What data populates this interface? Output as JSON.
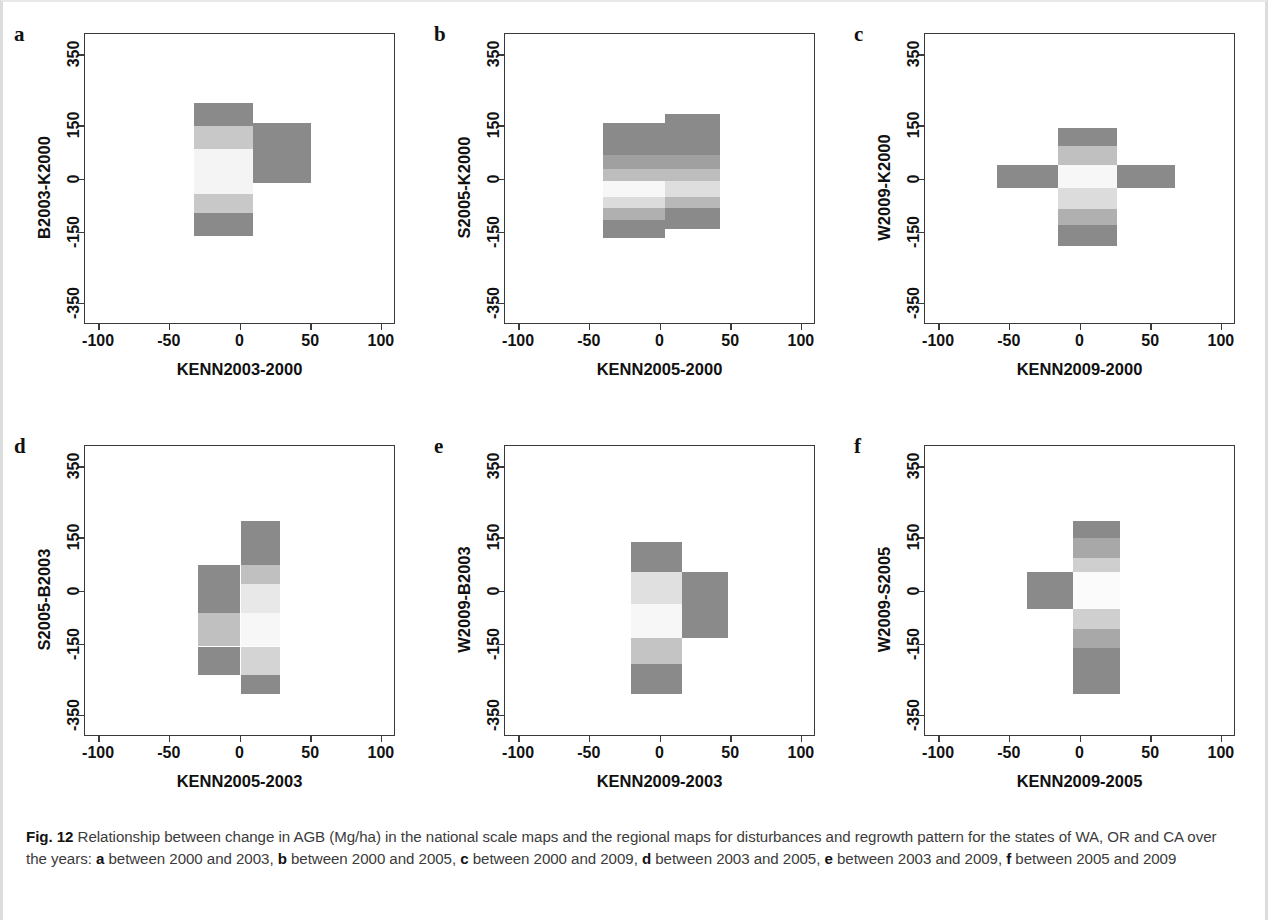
{
  "figure": {
    "number": "Fig. 12",
    "caption_parts": [
      {
        "t": "Fig. 12",
        "b": true
      },
      {
        "t": " Relationship between change in AGB (Mg/ha) in the national scale maps and the regional maps for disturbances and regrowth pattern for the states of WA, OR and CA over the years: ",
        "b": false
      },
      {
        "t": "a",
        "b": true
      },
      {
        "t": " between 2000 and 2003, ",
        "b": false
      },
      {
        "t": "b",
        "b": true
      },
      {
        "t": " between 2000 and 2005, ",
        "b": false
      },
      {
        "t": "c",
        "b": true
      },
      {
        "t": " between 2000 and 2009, ",
        "b": false
      },
      {
        "t": "d",
        "b": true
      },
      {
        "t": " between 2003 and 2005, ",
        "b": false
      },
      {
        "t": "e",
        "b": true
      },
      {
        "t": " between 2003 and 2009, ",
        "b": false
      },
      {
        "t": "f",
        "b": true
      },
      {
        "t": " between 2005 and 2009",
        "b": false
      }
    ],
    "caption_text": "Fig. 12 Relationship between change in AGB (Mg/ha) in the national scale maps and the regional maps for disturbances and regrowth pattern for the states of WA, OR and CA over the years: a between 2000 and 2003, b between 2000 and 2005, c between 2000 and 2009, d between 2003 and 2005, e between 2003 and 2009, f between 2005 and 2009"
  },
  "palette": {
    "dark_gray": "#8a8a8a",
    "mid_gray": "#a8a8a8",
    "light_gray": "#c8c8c8",
    "pale_gray": "#e2e2e2",
    "near_white": "#f7f7f7",
    "axis": "#3a3a3a",
    "text": "#111111",
    "caption": "#3b3b3b"
  },
  "axes_common": {
    "xticks": [
      "-100",
      "-50",
      "0",
      "50",
      "100"
    ],
    "xtick_values": [
      -100,
      -50,
      0,
      50,
      100
    ],
    "yticks": [
      "350",
      "150",
      "0",
      "-150",
      "-350"
    ],
    "ytick_values": [
      350,
      150,
      0,
      -150,
      -350
    ],
    "xlim": [
      -110,
      110
    ],
    "ylim": [
      -410,
      410
    ]
  },
  "chart_data": [
    {
      "type": "heatmap",
      "panel": "a",
      "letter": "a",
      "title": "",
      "xlabel": "KENN2003-2000",
      "ylabel": "B2003-K2000",
      "xlim": [
        -110,
        110
      ],
      "ylim": [
        -410,
        410
      ],
      "xticks": [
        -100,
        -50,
        0,
        50,
        100
      ],
      "yticks": [
        350,
        150,
        0,
        -150,
        -350
      ],
      "grid": false,
      "legend": "none",
      "cells": [
        {
          "x0": -33,
          "x1": 9,
          "y0": 150,
          "y1": 215,
          "shade": "#8a8a8a"
        },
        {
          "x0": -33,
          "x1": 9,
          "y0": 85,
          "y1": 150,
          "shade": "#c8c8c8"
        },
        {
          "x0": -33,
          "x1": 9,
          "y0": -40,
          "y1": 85,
          "shade": "#f4f4f4"
        },
        {
          "x0": -33,
          "x1": 9,
          "y0": -95,
          "y1": -40,
          "shade": "#c8c8c8"
        },
        {
          "x0": -33,
          "x1": 9,
          "y0": -160,
          "y1": -95,
          "shade": "#8a8a8a"
        },
        {
          "x0": 9,
          "x1": 50,
          "y0": -10,
          "y1": 160,
          "shade": "#8a8a8a"
        }
      ]
    },
    {
      "type": "heatmap",
      "panel": "b",
      "letter": "b",
      "title": "",
      "xlabel": "KENN2005-2000",
      "ylabel": "S2005-K2000",
      "xlim": [
        -110,
        110
      ],
      "ylim": [
        -410,
        410
      ],
      "xticks": [
        -100,
        -50,
        0,
        50,
        100
      ],
      "yticks": [
        350,
        150,
        0,
        -150,
        -350
      ],
      "grid": false,
      "legend": "none",
      "cells": [
        {
          "x0": -41,
          "x1": 3,
          "y0": 70,
          "y1": 160,
          "shade": "#8a8a8a"
        },
        {
          "x0": -41,
          "x1": 3,
          "y0": 30,
          "y1": 70,
          "shade": "#a0a0a0"
        },
        {
          "x0": -41,
          "x1": 3,
          "y0": -5,
          "y1": 30,
          "shade": "#bdbdbd"
        },
        {
          "x0": -41,
          "x1": 3,
          "y0": -48,
          "y1": -5,
          "shade": "#f7f7f7"
        },
        {
          "x0": -41,
          "x1": 3,
          "y0": -80,
          "y1": -48,
          "shade": "#dcdcdc"
        },
        {
          "x0": -41,
          "x1": 3,
          "y0": -115,
          "y1": -80,
          "shade": "#b0b0b0"
        },
        {
          "x0": -41,
          "x1": 3,
          "y0": -165,
          "y1": -115,
          "shade": "#8a8a8a"
        },
        {
          "x0": 3,
          "x1": 42,
          "y0": 70,
          "y1": 185,
          "shade": "#8a8a8a"
        },
        {
          "x0": 3,
          "x1": 42,
          "y0": 30,
          "y1": 70,
          "shade": "#a0a0a0"
        },
        {
          "x0": 3,
          "x1": 42,
          "y0": -5,
          "y1": 30,
          "shade": "#bdbdbd"
        },
        {
          "x0": 3,
          "x1": 42,
          "y0": -48,
          "y1": -5,
          "shade": "#dedede"
        },
        {
          "x0": 3,
          "x1": 42,
          "y0": -80,
          "y1": -48,
          "shade": "#b8b8b8"
        },
        {
          "x0": 3,
          "x1": 42,
          "y0": -140,
          "y1": -80,
          "shade": "#8a8a8a"
        }
      ]
    },
    {
      "type": "heatmap",
      "panel": "c",
      "letter": "c",
      "title": "",
      "xlabel": "KENN2009-2000",
      "ylabel": "W2009-K2000",
      "xlim": [
        -110,
        110
      ],
      "ylim": [
        -410,
        410
      ],
      "xticks": [
        -100,
        -50,
        0,
        50,
        100
      ],
      "yticks": [
        350,
        150,
        0,
        -150,
        -350
      ],
      "grid": false,
      "legend": "none",
      "cells": [
        {
          "x0": -16,
          "x1": 26,
          "y0": 95,
          "y1": 145,
          "shade": "#8a8a8a"
        },
        {
          "x0": -16,
          "x1": 26,
          "y0": 40,
          "y1": 95,
          "shade": "#c0c0c0"
        },
        {
          "x0": -16,
          "x1": 26,
          "y0": -25,
          "y1": 40,
          "shade": "#f7f7f7"
        },
        {
          "x0": -16,
          "x1": 26,
          "y0": -82,
          "y1": -25,
          "shade": "#dcdcdc"
        },
        {
          "x0": -16,
          "x1": 26,
          "y0": -128,
          "y1": -82,
          "shade": "#b0b0b0"
        },
        {
          "x0": -16,
          "x1": 26,
          "y0": -188,
          "y1": -128,
          "shade": "#8a8a8a"
        },
        {
          "x0": -59,
          "x1": -16,
          "y0": -25,
          "y1": 40,
          "shade": "#8a8a8a"
        },
        {
          "x0": 26,
          "x1": 67,
          "y0": -25,
          "y1": 40,
          "shade": "#8a8a8a"
        }
      ]
    },
    {
      "type": "heatmap",
      "panel": "d",
      "letter": "d",
      "title": "",
      "xlabel": "KENN2005-2003",
      "ylabel": "S2005-B2003",
      "xlim": [
        -110,
        110
      ],
      "ylim": [
        -410,
        410
      ],
      "xticks": [
        -100,
        -50,
        0,
        50,
        100
      ],
      "yticks": [
        350,
        150,
        0,
        -150,
        -350
      ],
      "grid": false,
      "legend": "none",
      "cells": [
        {
          "x0": -30,
          "x1": 0,
          "y0": -60,
          "y1": 75,
          "shade": "#8a8a8a"
        },
        {
          "x0": -30,
          "x1": 0,
          "y0": -155,
          "y1": -60,
          "shade": "#c0c0c0"
        },
        {
          "x0": -30,
          "x1": 0,
          "y0": -235,
          "y1": -155,
          "shade": "#8a8a8a"
        },
        {
          "x0": 0,
          "x1": 28,
          "y0": 75,
          "y1": 200,
          "shade": "#8a8a8a"
        },
        {
          "x0": 0,
          "x1": 28,
          "y0": 20,
          "y1": 75,
          "shade": "#c0c0c0"
        },
        {
          "x0": 0,
          "x1": 28,
          "y0": -60,
          "y1": 20,
          "shade": "#e8e8e8"
        },
        {
          "x0": 0,
          "x1": 28,
          "y0": -155,
          "y1": -60,
          "shade": "#f7f7f7"
        },
        {
          "x0": 0,
          "x1": 28,
          "y0": -235,
          "y1": -155,
          "shade": "#d4d4d4"
        },
        {
          "x0": 0,
          "x1": 28,
          "y0": -290,
          "y1": -235,
          "shade": "#8a8a8a"
        }
      ]
    },
    {
      "type": "heatmap",
      "panel": "e",
      "letter": "e",
      "title": "",
      "xlabel": "KENN2009-2003",
      "ylabel": "W2009-B2003",
      "xlim": [
        -110,
        110
      ],
      "ylim": [
        -410,
        410
      ],
      "xticks": [
        -100,
        -50,
        0,
        50,
        100
      ],
      "yticks": [
        350,
        150,
        0,
        -150,
        -350
      ],
      "grid": false,
      "legend": "none",
      "cells": [
        {
          "x0": -21,
          "x1": 15,
          "y0": 55,
          "y1": 140,
          "shade": "#8a8a8a"
        },
        {
          "x0": -21,
          "x1": 15,
          "y0": -35,
          "y1": 55,
          "shade": "#e0e0e0"
        },
        {
          "x0": -21,
          "x1": 15,
          "y0": -130,
          "y1": -35,
          "shade": "#f7f7f7"
        },
        {
          "x0": -21,
          "x1": 15,
          "y0": -205,
          "y1": -130,
          "shade": "#c4c4c4"
        },
        {
          "x0": -21,
          "x1": 15,
          "y0": -290,
          "y1": -205,
          "shade": "#8a8a8a"
        },
        {
          "x0": 15,
          "x1": 48,
          "y0": -130,
          "y1": 55,
          "shade": "#8a8a8a"
        }
      ]
    },
    {
      "type": "heatmap",
      "panel": "f",
      "letter": "f",
      "title": "",
      "xlabel": "KENN2009-2005",
      "ylabel": "W2009-S2005",
      "xlim": [
        -110,
        110
      ],
      "ylim": [
        -410,
        410
      ],
      "xticks": [
        -100,
        -50,
        0,
        50,
        100
      ],
      "yticks": [
        350,
        150,
        0,
        -150,
        -350
      ],
      "grid": false,
      "legend": "none",
      "cells": [
        {
          "x0": -5,
          "x1": 28,
          "y0": 150,
          "y1": 200,
          "shade": "#8a8a8a"
        },
        {
          "x0": -5,
          "x1": 28,
          "y0": 95,
          "y1": 150,
          "shade": "#a8a8a8"
        },
        {
          "x0": -5,
          "x1": 28,
          "y0": 55,
          "y1": 95,
          "shade": "#cfcfcf"
        },
        {
          "x0": -5,
          "x1": 28,
          "y0": -50,
          "y1": 55,
          "shade": "#fbfbfb"
        },
        {
          "x0": -5,
          "x1": 28,
          "y0": -105,
          "y1": -50,
          "shade": "#cfcfcf"
        },
        {
          "x0": -5,
          "x1": 28,
          "y0": -160,
          "y1": -105,
          "shade": "#a8a8a8"
        },
        {
          "x0": -5,
          "x1": 28,
          "y0": -290,
          "y1": -160,
          "shade": "#8a8a8a"
        },
        {
          "x0": -38,
          "x1": -5,
          "y0": -50,
          "y1": 55,
          "shade": "#8a8a8a"
        }
      ]
    }
  ]
}
